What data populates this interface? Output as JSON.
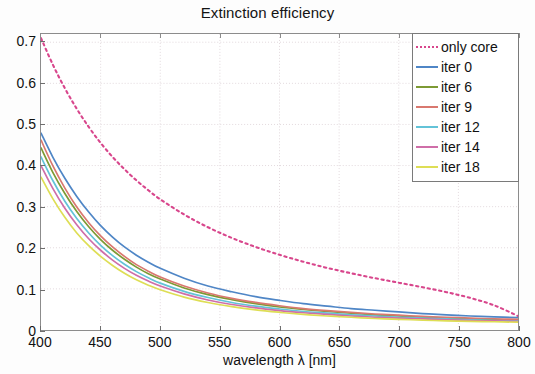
{
  "chart_data": {
    "type": "line",
    "title": "Extinction efficiency",
    "xlabel": "wavelength λ [nm]",
    "ylabel": "",
    "xlim": [
      400,
      800
    ],
    "ylim": [
      0,
      0.72
    ],
    "xticks": [
      400,
      450,
      500,
      550,
      600,
      650,
      700,
      750,
      800
    ],
    "yticks": [
      "0",
      "0.1",
      "0.2",
      "0.3",
      "0.4",
      "0.5",
      "0.6",
      "0.7"
    ],
    "ytick_values": [
      0,
      0.1,
      0.2,
      0.3,
      0.4,
      0.5,
      0.6,
      0.7
    ],
    "grid": true,
    "legend_position": "top-right",
    "x": [
      400,
      410,
      420,
      430,
      440,
      450,
      460,
      470,
      480,
      490,
      500,
      520,
      540,
      560,
      580,
      600,
      620,
      640,
      660,
      680,
      700,
      720,
      740,
      760,
      780,
      800
    ],
    "series": [
      {
        "name": "only core",
        "color": "#d8468c",
        "style": "dotted",
        "width": 2.1,
        "values": [
          0.71,
          0.645,
          0.588,
          0.538,
          0.494,
          0.455,
          0.421,
          0.391,
          0.364,
          0.34,
          0.318,
          0.281,
          0.25,
          0.224,
          0.202,
          0.183,
          0.166,
          0.151,
          0.138,
          0.126,
          0.115,
          0.104,
          0.092,
          0.078,
          0.06,
          0.034
        ]
      },
      {
        "name": "iter 0",
        "color": "#4f86c6",
        "style": "solid",
        "width": 1.7,
        "values": [
          0.479,
          0.42,
          0.369,
          0.325,
          0.287,
          0.254,
          0.226,
          0.202,
          0.182,
          0.165,
          0.15,
          0.126,
          0.107,
          0.093,
          0.081,
          0.072,
          0.064,
          0.058,
          0.052,
          0.048,
          0.044,
          0.04,
          0.037,
          0.034,
          0.032,
          0.03
        ]
      },
      {
        "name": "iter 6",
        "color": "#7d9a34",
        "style": "solid",
        "width": 1.7,
        "values": [
          0.443,
          0.383,
          0.332,
          0.288,
          0.251,
          0.22,
          0.194,
          0.172,
          0.153,
          0.137,
          0.124,
          0.102,
          0.086,
          0.074,
          0.064,
          0.056,
          0.05,
          0.045,
          0.041,
          0.037,
          0.034,
          0.031,
          0.029,
          0.027,
          0.025,
          0.024
        ]
      },
      {
        "name": "iter 9",
        "color": "#d9786f",
        "style": "solid",
        "width": 1.7,
        "values": [
          0.462,
          0.399,
          0.345,
          0.299,
          0.261,
          0.229,
          0.202,
          0.179,
          0.159,
          0.143,
          0.129,
          0.107,
          0.09,
          0.077,
          0.067,
          0.059,
          0.052,
          0.047,
          0.043,
          0.039,
          0.036,
          0.033,
          0.031,
          0.029,
          0.027,
          0.026
        ]
      },
      {
        "name": "iter 12",
        "color": "#63c3d8",
        "style": "solid",
        "width": 1.7,
        "values": [
          0.421,
          0.363,
          0.313,
          0.271,
          0.236,
          0.206,
          0.181,
          0.16,
          0.142,
          0.127,
          0.114,
          0.094,
          0.079,
          0.067,
          0.058,
          0.051,
          0.045,
          0.041,
          0.037,
          0.034,
          0.031,
          0.029,
          0.027,
          0.025,
          0.023,
          0.022
        ]
      },
      {
        "name": "iter 14",
        "color": "#cf6ea8",
        "style": "solid",
        "width": 1.7,
        "values": [
          0.4,
          0.344,
          0.296,
          0.256,
          0.222,
          0.194,
          0.17,
          0.15,
          0.133,
          0.119,
          0.107,
          0.088,
          0.073,
          0.062,
          0.054,
          0.047,
          0.042,
          0.038,
          0.034,
          0.031,
          0.029,
          0.027,
          0.025,
          0.023,
          0.022,
          0.021
        ]
      },
      {
        "name": "iter 18",
        "color": "#dede55",
        "style": "solid",
        "width": 1.7,
        "values": [
          0.372,
          0.319,
          0.274,
          0.236,
          0.205,
          0.179,
          0.157,
          0.138,
          0.122,
          0.109,
          0.098,
          0.08,
          0.067,
          0.057,
          0.049,
          0.043,
          0.038,
          0.034,
          0.031,
          0.028,
          0.026,
          0.024,
          0.022,
          0.021,
          0.02,
          0.019
        ]
      }
    ]
  },
  "legend": {
    "items": [
      {
        "label": "only core"
      },
      {
        "label": "iter 0"
      },
      {
        "label": "iter 6"
      },
      {
        "label": "iter 9"
      },
      {
        "label": "iter 12"
      },
      {
        "label": "iter 14"
      },
      {
        "label": "iter 18"
      }
    ]
  },
  "axes": {
    "x_title": "wavelength λ [nm]",
    "x_tick_labels": [
      "400",
      "450",
      "500",
      "550",
      "600",
      "650",
      "700",
      "750",
      "800"
    ],
    "y_tick_labels": [
      "0",
      "0.1",
      "0.2",
      "0.3",
      "0.4",
      "0.5",
      "0.6",
      "0.7"
    ]
  },
  "colors": {
    "grid": "#e2d9dd",
    "frame": "#8c8c8c",
    "background": "#ffffff"
  }
}
